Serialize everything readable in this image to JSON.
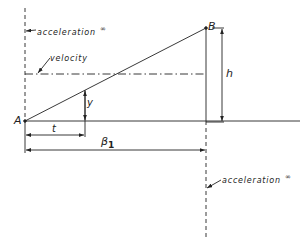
{
  "diagram": {
    "labels": {
      "point_a": "A",
      "point_b": "B",
      "acceleration_top": "acceleration",
      "acceleration_top_sup": "∞",
      "acceleration_bottom": "acceleration",
      "acceleration_bottom_sup": "∞",
      "velocity": "velocity",
      "height": "h",
      "y_offset": "y",
      "t_span": "t",
      "beta_symbol": "β",
      "beta_subscript": "1"
    },
    "colors": {
      "line": "#222222",
      "background": "#ffffff"
    }
  }
}
